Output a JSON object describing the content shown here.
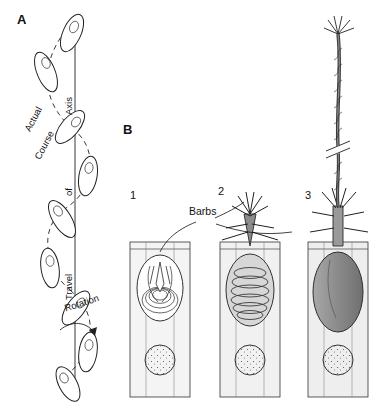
{
  "figure": {
    "panels": [
      {
        "id": "A",
        "label": "A"
      },
      {
        "id": "B",
        "label": "B"
      }
    ],
    "panel_a": {
      "labels": [
        {
          "name": "actual",
          "text": "Actual"
        },
        {
          "name": "course",
          "text": "Course"
        },
        {
          "name": "axis",
          "text": "Axis"
        },
        {
          "name": "of",
          "text": "of"
        },
        {
          "name": "travel",
          "text": "Travel"
        },
        {
          "name": "rotation",
          "text": "Rotation"
        }
      ]
    },
    "panel_b": {
      "stage_numbers": [
        "1",
        "2",
        "3"
      ],
      "callout": "Barbs"
    }
  },
  "colors": {
    "ink": "#1a1a1a",
    "fill_light": "#efefef",
    "fill_mid": "#b9b9b9",
    "fill_dark": "#8f8f8f",
    "background": "#ffffff"
  }
}
